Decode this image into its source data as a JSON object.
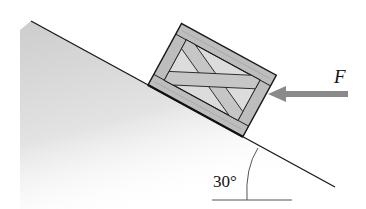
{
  "diagram": {
    "force_label": "F",
    "angle_label": "30°",
    "colors": {
      "line": "#1a1a1a",
      "incline_shade": "#c8c8c8",
      "crate_wood": "#bdbdbd",
      "crate_inner": "#d9d9d9",
      "arrow": "#8a8a8a"
    }
  }
}
